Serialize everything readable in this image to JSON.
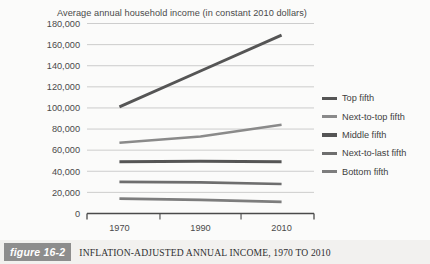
{
  "chart_data": {
    "type": "line",
    "title": "Average annual household income (in constant 2010 dollars)",
    "xlabel": "",
    "ylabel": "",
    "x": [
      1970,
      1990,
      2010
    ],
    "categories": [
      "1970",
      "1990",
      "2010"
    ],
    "xlim": [
      1962,
      2018
    ],
    "ylim": [
      0,
      180000
    ],
    "ytick_labels": [
      "180,000",
      "160,000",
      "140,000",
      "120,000",
      "100,000",
      "80,000",
      "60,000",
      "40,000",
      "20,000",
      "0"
    ],
    "ytick_values": [
      180000,
      160000,
      140000,
      120000,
      100000,
      80000,
      60000,
      40000,
      20000,
      0
    ],
    "xtick_labels": [
      "1970",
      "1990",
      "2010"
    ],
    "grid": "horizontal",
    "legend_position": "right",
    "series": [
      {
        "name": "Top fifth",
        "values": [
          101000,
          135000,
          169000
        ],
        "color": "#555555"
      },
      {
        "name": "Next-to-top fifth",
        "values": [
          67000,
          73000,
          84000
        ],
        "color": "#8a8a8a"
      },
      {
        "name": "Middle fifth",
        "values": [
          49000,
          49500,
          49000
        ],
        "color": "#555555"
      },
      {
        "name": "Next-to-last fifth",
        "values": [
          30000,
          29500,
          28000
        ],
        "color": "#6e6e6e"
      },
      {
        "name": "Bottom fifth",
        "values": [
          14000,
          13000,
          11000
        ],
        "color": "#7d7d7d"
      }
    ]
  },
  "legend": {
    "items": [
      {
        "label": "Top fifth"
      },
      {
        "label": "Next-to-top fifth"
      },
      {
        "label": "Middle fifth"
      },
      {
        "label": "Next-to-last fifth"
      },
      {
        "label": "Bottom fifth"
      }
    ]
  },
  "caption": {
    "badge": "figure 16-2",
    "text": "INFLATION-ADJUSTED ANNUAL INCOME, 1970 TO 2010"
  },
  "colors": {
    "page_background": "#fbfbfa",
    "caption_background": "#f2f1ef",
    "badge_background": "#8d8d8d",
    "gridline": "#b9b9b9",
    "axis": "#4a4a4a",
    "text": "#3f3f3f"
  }
}
